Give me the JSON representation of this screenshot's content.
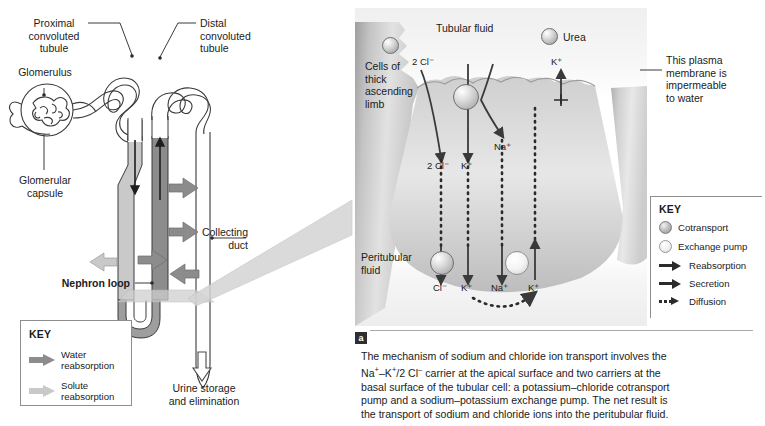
{
  "figure": {
    "type": "biology-diagram"
  },
  "nephron_panel": {
    "labels": {
      "proximal": "Proximal\nconvoluted\ntubule",
      "proximal_l1": "Proximal",
      "proximal_l2": "convoluted",
      "proximal_l3": "tubule",
      "glomerulus": "Glomerulus",
      "glomerular_capsule_l1": "Glomerular",
      "glomerular_capsule_l2": "capsule",
      "distal_l1": "Distal",
      "distal_l2": "convoluted",
      "distal_l3": "tubule",
      "nephron_loop": "Nephron loop",
      "collecting_l1": "Collecting",
      "collecting_l2": "duct",
      "urine_l1": "Urine storage",
      "urine_l2": "and elimination"
    },
    "key": {
      "title": "KEY",
      "items": [
        {
          "icon": "block-arrow-dark",
          "label_l1": "Water",
          "label_l2": "reabsorption"
        },
        {
          "icon": "block-arrow-light",
          "label_l1": "Solute",
          "label_l2": "reabsorption"
        }
      ]
    }
  },
  "cell_panel": {
    "labels": {
      "cells_l1": "Cells of",
      "cells_l2": "thick",
      "cells_l3": "ascending",
      "cells_l4": "limb",
      "tubular_fluid": "Tubular fluid",
      "urea": "Urea",
      "peritubular_l1": "Peritubular",
      "peritubular_l2": "fluid"
    },
    "apical_ions": {
      "cl_in": "2 Cl⁻",
      "cl_out": "2 Cl⁻",
      "k_out": "K⁺",
      "na_out": "Na⁺",
      "k_leak": "K⁺"
    },
    "basal_ions": {
      "cl": "Cl⁻",
      "k1": "K⁺",
      "na": "Na⁺",
      "k2": "K⁺"
    },
    "callout_l1": "This plasma",
    "callout_l2": "membrane is",
    "callout_l3": "impermeable",
    "callout_l4": "to water",
    "key": {
      "title": "KEY",
      "items": [
        {
          "icon": "cotransport-sphere",
          "label": "Cotransport"
        },
        {
          "icon": "exchange-pump-sphere",
          "label": "Exchange pump"
        },
        {
          "icon": "solid-arrow",
          "label": "Reabsorption"
        },
        {
          "icon": "solid-arrow",
          "label": "Secretion"
        },
        {
          "icon": "dotted-arrow",
          "label": "Diffusion"
        }
      ]
    }
  },
  "caption": {
    "badge": "a",
    "line1": "The mechanism of sodium and chloride ion transport involves the",
    "line2_a": "Na",
    "line2_b": "–K",
    "line2_c": "/2 Cl",
    "line2_d": " carrier at the apical surface and two carriers at the",
    "line3": "basal surface of the tubular cell: a potassium–chloride cotransport",
    "line4": "pump and a sodium–potassium exchange pump. The net result is",
    "line5": "the transport of sodium and chloride ions into the peritubular fluid."
  },
  "colors": {
    "tubule_fill_dark": "#8c8c8c",
    "tubule_fill_light": "#c9c9c9",
    "outline": "#3a3a3a",
    "text": "#1b1b1b",
    "panel_bg": "#ededed"
  }
}
